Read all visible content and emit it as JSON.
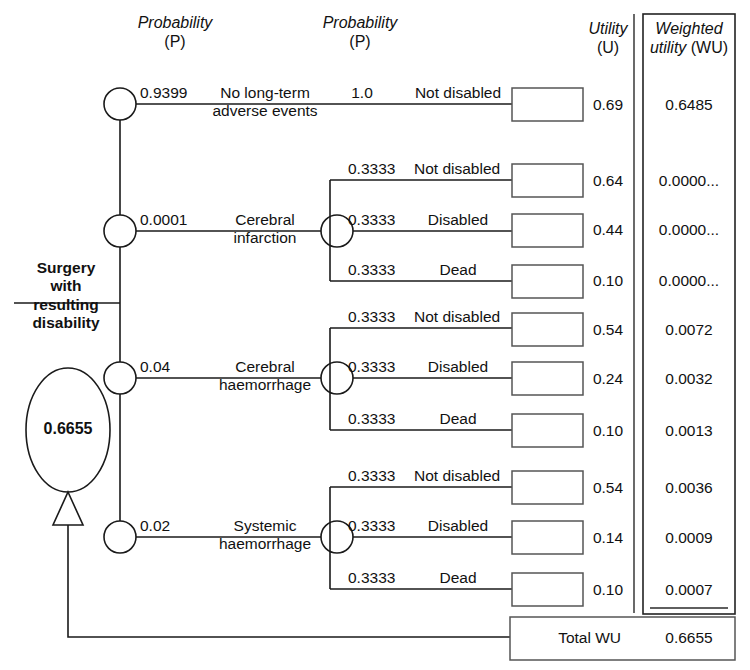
{
  "diagram": {
    "headers": {
      "prob1_line1": "Probability",
      "prob1_line2": "(P)",
      "prob2_line1": "Probability",
      "prob2_line2": "(P)",
      "utility_line1": "Utility",
      "utility_line2": "(U)",
      "wu_line1": "Weighted",
      "wu_line2_italic": "utility",
      "wu_line2_plain": " (WU)"
    },
    "root": {
      "label_line1": "Surgery",
      "label_line2": "with",
      "label_line3": "resulting",
      "label_line4": "disability",
      "expected_value": "0.6655"
    },
    "branches": [
      {
        "probability": "0.9399",
        "name_line1": "No long-term",
        "name_line2": "adverse events",
        "outcomes": [
          {
            "probability": "1.0",
            "label": "Not disabled",
            "utility": "0.69",
            "weighted_utility": "0.6485"
          }
        ]
      },
      {
        "probability": "0.0001",
        "name_line1": "Cerebral",
        "name_line2": "infarction",
        "outcomes": [
          {
            "probability": "0.3333",
            "label": "Not disabled",
            "utility": "0.64",
            "weighted_utility": "0.0000..."
          },
          {
            "probability": "0.3333",
            "label": "Disabled",
            "utility": "0.44",
            "weighted_utility": "0.0000..."
          },
          {
            "probability": "0.3333",
            "label": "Dead",
            "utility": "0.10",
            "weighted_utility": "0.0000..."
          }
        ]
      },
      {
        "probability": "0.04",
        "name_line1": "Cerebral",
        "name_line2": "haemorrhage",
        "outcomes": [
          {
            "probability": "0.3333",
            "label": "Not disabled",
            "utility": "0.54",
            "weighted_utility": "0.0072"
          },
          {
            "probability": "0.3333",
            "label": "Disabled",
            "utility": "0.24",
            "weighted_utility": "0.0032"
          },
          {
            "probability": "0.3333",
            "label": "Dead",
            "utility": "0.10",
            "weighted_utility": "0.0013"
          }
        ]
      },
      {
        "probability": "0.02",
        "name_line1": "Systemic",
        "name_line2": "haemorrhage",
        "outcomes": [
          {
            "probability": "0.3333",
            "label": "Not disabled",
            "utility": "0.54",
            "weighted_utility": "0.0036"
          },
          {
            "probability": "0.3333",
            "label": "Disabled",
            "utility": "0.14",
            "weighted_utility": "0.0009"
          },
          {
            "probability": "0.3333",
            "label": "Dead",
            "utility": "0.10",
            "weighted_utility": "0.0007"
          }
        ]
      }
    ],
    "total": {
      "label": "Total WU",
      "value": "0.6655"
    }
  }
}
